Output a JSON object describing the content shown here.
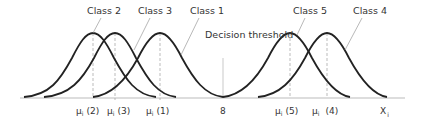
{
  "diagram": {
    "classes": [
      {
        "label": "Class 2",
        "mean_label": "μ",
        "mean_sub": "i",
        "mean_idx": "(2)"
      },
      {
        "label": "Class 3",
        "mean_label": "μ",
        "mean_sub": "i",
        "mean_idx": "(3)"
      },
      {
        "label": "Class 1",
        "mean_label": "μ",
        "mean_sub": "i",
        "mean_idx": "(1)"
      },
      {
        "label": "Class 5",
        "mean_label": "μ",
        "mean_sub": "i",
        "mean_idx": "(5)"
      },
      {
        "label": "Class 4",
        "mean_label": "μ",
        "mean_sub": "i",
        "mean_idx": "(4)"
      }
    ],
    "threshold": {
      "label": "Decision threshold",
      "value": "8"
    },
    "axis": {
      "label": "X",
      "sub": "i"
    }
  }
}
